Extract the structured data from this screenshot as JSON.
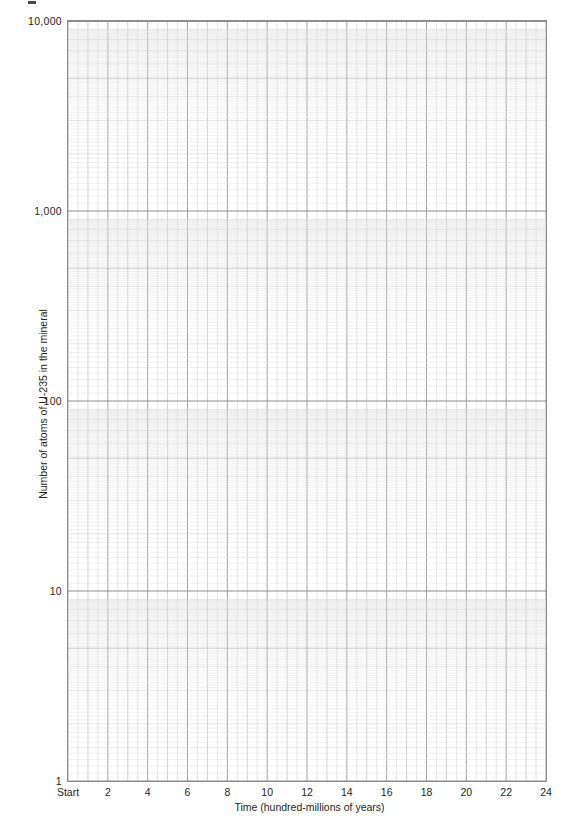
{
  "figure": {
    "type": "blank-semilog-graph-paper",
    "background_color": "#ffffff",
    "grid_major_color": "#9a9a9a",
    "grid_minor_color": "#d2d2d2",
    "grid_decade_color": "#8d8d8d",
    "text_color": "#231f20"
  },
  "chart_data": {
    "type": "line",
    "title": "",
    "xlabel": "Time (hundred-millions of years)",
    "ylabel": "Number of atoms of U-235 in the mineral",
    "x": [],
    "values": [],
    "series": [],
    "xlim": [
      0,
      24
    ],
    "ylim": [
      1,
      10000
    ],
    "yscale": "log",
    "xscale": "linear",
    "grid": true,
    "legend": "none",
    "x_tick_labels": [
      "Start",
      "2",
      "4",
      "6",
      "8",
      "10",
      "12",
      "14",
      "16",
      "18",
      "20",
      "22",
      "24"
    ],
    "x_tick_values": [
      0,
      2,
      4,
      6,
      8,
      10,
      12,
      14,
      16,
      18,
      20,
      22,
      24
    ],
    "x_minor_divisions_per_unit": 2,
    "y_tick_labels": [
      "10,000",
      "1,000",
      "100",
      "10",
      "1"
    ],
    "y_tick_values": [
      10000,
      1000,
      100,
      10,
      1
    ],
    "y_decades": 4,
    "annotations": []
  },
  "axes": {
    "y": {
      "title": "Number of atoms of U-235 in the mineral",
      "ticks": [
        {
          "label": "10,000",
          "value": 10000
        },
        {
          "label": "1,000",
          "value": 1000
        },
        {
          "label": "100",
          "value": 100
        },
        {
          "label": "10",
          "value": 10
        },
        {
          "label": "1",
          "value": 1
        }
      ]
    },
    "x": {
      "title": "Time (hundred-millions of years)",
      "ticks": [
        {
          "label": "Start",
          "value": 0
        },
        {
          "label": "2",
          "value": 2
        },
        {
          "label": "4",
          "value": 4
        },
        {
          "label": "6",
          "value": 6
        },
        {
          "label": "8",
          "value": 8
        },
        {
          "label": "10",
          "value": 10
        },
        {
          "label": "12",
          "value": 12
        },
        {
          "label": "14",
          "value": 14
        },
        {
          "label": "16",
          "value": 16
        },
        {
          "label": "18",
          "value": 18
        },
        {
          "label": "20",
          "value": 20
        },
        {
          "label": "22",
          "value": 22
        },
        {
          "label": "24",
          "value": 24
        }
      ]
    }
  }
}
